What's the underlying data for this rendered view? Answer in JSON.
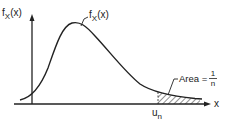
{
  "diagram": {
    "y_axis_label": {
      "main": "f",
      "sub": "X",
      "arg": "(x)"
    },
    "curve_label": {
      "main": "f",
      "sub": "X",
      "arg": "(x)"
    },
    "x_axis_label": "x",
    "threshold_label": {
      "main": "u",
      "sub": "n"
    },
    "area_label": {
      "prefix": "Area =",
      "numerator": "1",
      "denominator": "n"
    },
    "colors": {
      "ink": "#222222",
      "background": "#ffffff"
    }
  }
}
